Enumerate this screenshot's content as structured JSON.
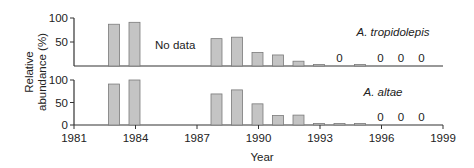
{
  "chart_data": {
    "type": "bar",
    "layout": "two stacked panels sharing x-axis",
    "xlabel": "Year",
    "ylabel": "Relative abundance (%)",
    "x_ticks": [
      1981,
      1984,
      1987,
      1990,
      1993,
      1996,
      1999
    ],
    "x_range": [
      1981,
      1999
    ],
    "grid": false,
    "bar_color": "#c4c4c4",
    "bar_edge_color": "#7a7a7a",
    "panels": [
      {
        "name": "A. tropidolepis",
        "y_ticks": [
          50,
          100
        ],
        "ylim": [
          0,
          100
        ],
        "annotation": "No data",
        "years": [
          1983,
          1984,
          1988,
          1989,
          1990,
          1991,
          1992,
          1993,
          1994,
          1995,
          1996,
          1997,
          1998
        ],
        "values": [
          87,
          91,
          57,
          60,
          28,
          23,
          10,
          3,
          0,
          3,
          0,
          0,
          0
        ],
        "zero_labels": [
          1994,
          1996,
          1997,
          1998
        ]
      },
      {
        "name": "A. altae",
        "y_ticks": [
          0,
          50,
          100
        ],
        "ylim": [
          0,
          100
        ],
        "years": [
          1983,
          1984,
          1988,
          1989,
          1990,
          1991,
          1992,
          1993,
          1994,
          1995,
          1996,
          1997,
          1998
        ],
        "values": [
          91,
          100,
          69,
          78,
          47,
          21,
          22,
          2,
          2,
          2,
          0,
          0,
          0
        ],
        "zero_labels": [
          1996,
          1997,
          1998
        ]
      }
    ]
  },
  "labels": {
    "xlabel": "Year",
    "ylabel_line1": "Relative",
    "ylabel_line2": "abundance (%)",
    "zero": "0"
  }
}
